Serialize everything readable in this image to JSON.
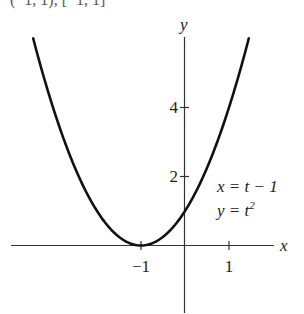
{
  "caption": "(−1, 1), [−1, 1]",
  "chart_data": {
    "type": "line",
    "title": "",
    "xlabel": "x",
    "ylabel": "y",
    "x_ticks": [
      -1,
      1
    ],
    "y_ticks": [
      2,
      4
    ],
    "xlim": [
      -3.45,
      1.45
    ],
    "ylim": [
      0,
      6
    ],
    "grid": false,
    "legend": [],
    "annotations": [
      "x = t − 1",
      "y = t²"
    ],
    "series": [
      {
        "name": "parametric curve x = t − 1, y = t²",
        "x": [
          -3.45,
          -3,
          -2.5,
          -2,
          -1.5,
          -1,
          -0.5,
          0,
          0.5,
          1,
          1.45
        ],
        "y": [
          6.0,
          4.0,
          2.25,
          1.0,
          0.25,
          0,
          0.25,
          1.0,
          2.25,
          4.0,
          6.0
        ]
      }
    ]
  },
  "labels": {
    "x_axis": "x",
    "y_axis": "y",
    "tick_x_neg1": "−1",
    "tick_x_1": "1",
    "tick_y_2": "2",
    "tick_y_4": "4",
    "eq1": "x = t − 1",
    "eq2_base": "y = t",
    "eq2_sup": "2"
  }
}
